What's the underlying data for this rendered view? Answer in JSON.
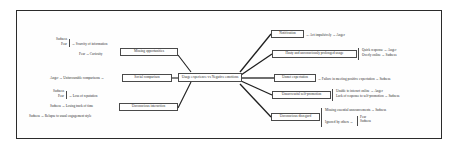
{
  "figure": {
    "arrow": "→",
    "center_node": "Usage experience vs Negative emotions"
  },
  "left_branch": {
    "nodes": [
      {
        "id": "missing-opportunities",
        "label": "Missing opportunities"
      },
      {
        "id": "social-comparison",
        "label": "Social comparison"
      },
      {
        "id": "unconscious-interaction",
        "label": "Unconscious interaction"
      }
    ],
    "missing_opportunities_causes": [
      {
        "trigger": "Scarcity of information",
        "emotions": [
          "Sadness",
          "Fear"
        ],
        "braced": true
      },
      {
        "trigger": "Curiosity",
        "emotions": [
          "Fear"
        ],
        "braced": false
      }
    ],
    "social_comparison_causes": [
      {
        "trigger": "Unfavourable comparisons",
        "emotions": [
          "Anger"
        ],
        "braced": false
      }
    ],
    "unconscious_interaction_causes": [
      {
        "trigger": "Loss of reputation",
        "emotions": [
          "Sadness",
          "Fear"
        ],
        "braced": true
      },
      {
        "trigger": "Losing track of time",
        "emotions": [
          "Sadness"
        ],
        "braced": false
      },
      {
        "trigger": "Relapse to usual engagement style",
        "emotions": [
          "Sadness"
        ],
        "braced": false
      }
    ]
  },
  "right_branch": {
    "nodes": [
      {
        "id": "notification",
        "label": "Notification"
      },
      {
        "id": "hasty-usage",
        "label": "Hasty and unconsciously prolonged usage"
      },
      {
        "id": "unmet-expectation",
        "label": "Unmet expectation"
      },
      {
        "id": "unsuccessful-self-promotion",
        "label": "Unsuccessful self-promotion"
      },
      {
        "id": "unconscious-disregard",
        "label": "Unconscious disregard"
      }
    ],
    "notification_effects": [
      {
        "outcome": "Act impulsively",
        "emotions": [
          "Anger"
        ]
      }
    ],
    "hasty_usage_effects": [
      {
        "outcome": "Quick response",
        "emotions": [
          "Anger"
        ]
      },
      {
        "outcome": "Overly online",
        "emotions": [
          "Sadness"
        ]
      }
    ],
    "unmet_expectation_effects": [
      {
        "outcome": "Failure in meeting positive expectation",
        "emotions": [
          "Sadness"
        ]
      }
    ],
    "unsuccessful_self_promotion_effects": [
      {
        "outcome": "Unable to interact online",
        "emotions": [
          "Anger"
        ]
      },
      {
        "outcome": "Lack of response to self-promotion",
        "emotions": [
          "Sadness"
        ]
      }
    ],
    "unconscious_disregard_effects": [
      {
        "outcome": "Missing essential announcements",
        "emotions": [
          "Sadness"
        ]
      },
      {
        "outcome": "Ignored by others",
        "emotions": [
          "Fear",
          "Sadness"
        ],
        "braced": true
      }
    ]
  },
  "colors": {
    "frame": "#2b2b2b",
    "box_border": "#4a4a4a",
    "text": "#2a2a2a",
    "edge": "#1f1f1f",
    "background": "#ffffff"
  }
}
